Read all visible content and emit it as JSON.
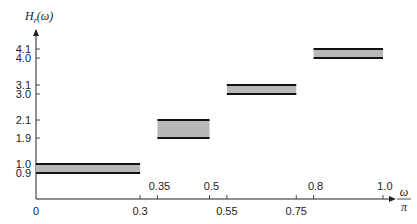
{
  "chart_data": {
    "type": "bar",
    "title": "",
    "ylabel": "H_r(ω)",
    "ylabel_main": "H",
    "ylabel_sub": "r",
    "ylabel_arg": "(ω)",
    "xlabel_num": "ω",
    "xlabel_den": "π",
    "xlabel": "ω/π",
    "xlim": [
      0,
      1.0
    ],
    "grid": false,
    "x_ticks_bottom": [
      "0",
      "0.3",
      "0.55",
      "0.75"
    ],
    "x_ticks_top": [
      "0.35",
      "0.5",
      "0.8",
      "1.0"
    ],
    "y_ticks": [
      "0.9",
      "1.0",
      "1.9",
      "2.1",
      "3.0",
      "3.1",
      "4.0",
      "4.1"
    ],
    "bands": [
      {
        "x_start": 0.0,
        "x_end": 0.3,
        "y_low": 0.9,
        "y_high": 1.0
      },
      {
        "x_start": 0.35,
        "x_end": 0.5,
        "y_low": 1.9,
        "y_high": 2.1
      },
      {
        "x_start": 0.55,
        "x_end": 0.75,
        "y_low": 3.0,
        "y_high": 3.1
      },
      {
        "x_start": 0.8,
        "x_end": 1.0,
        "y_low": 4.0,
        "y_high": 4.1
      }
    ],
    "colors": {
      "band_fill": "#b8b8b8",
      "band_edge": "#111111",
      "axis": "#222222"
    }
  }
}
